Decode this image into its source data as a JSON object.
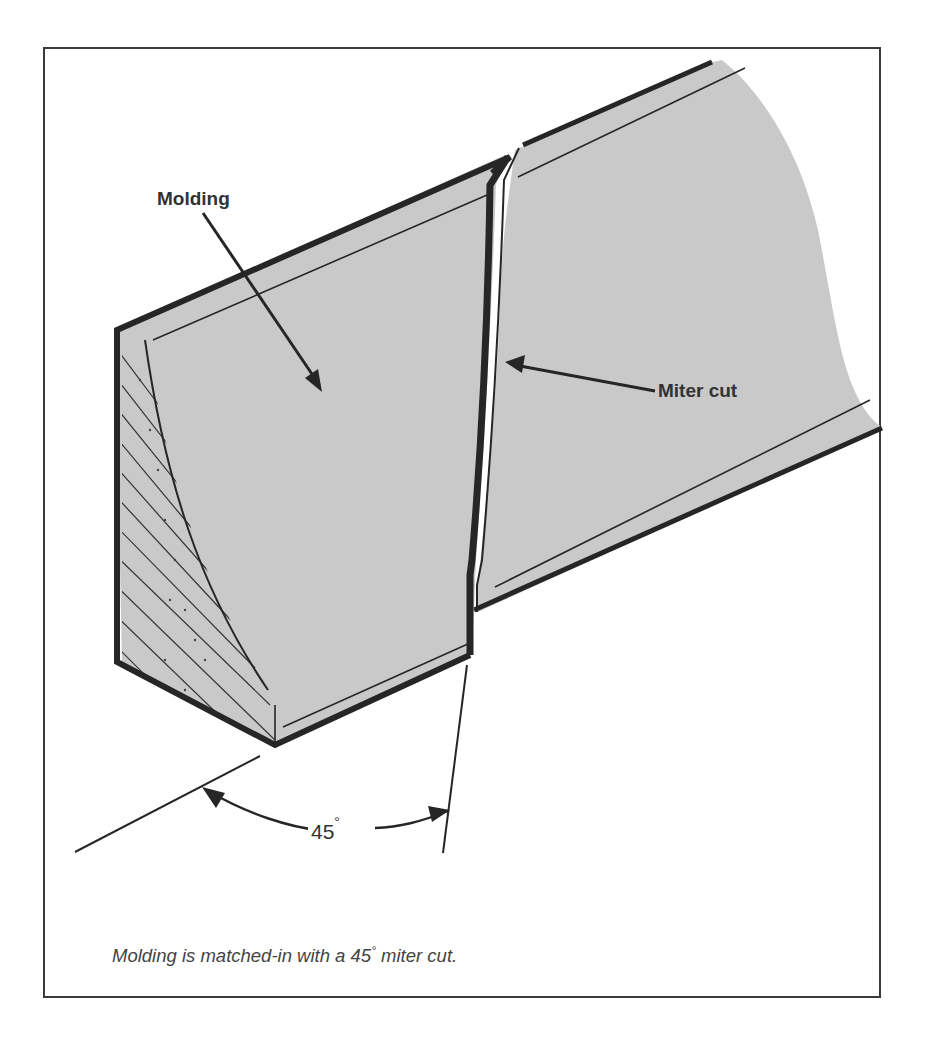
{
  "figure": {
    "labels": {
      "molding": "Molding",
      "miter_cut": "Miter cut"
    },
    "angle": {
      "value": "45",
      "unit": "°"
    },
    "caption": {
      "before": "Molding is matched-in with a 45",
      "degree": "°",
      "after": " miter cut."
    }
  },
  "colors": {
    "face": "#c8c8c8",
    "outline": "#262626",
    "frame": "#3a3a3a",
    "text": "#333333"
  }
}
